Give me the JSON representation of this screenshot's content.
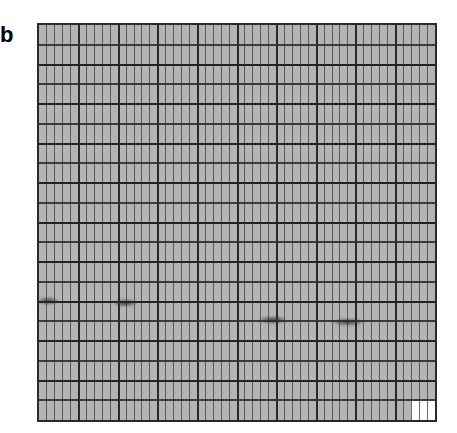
{
  "panel": {
    "label": "b"
  },
  "grid": {
    "columns": 50,
    "rows": 20,
    "major_column_every": 5,
    "background_color": "#b4b4b4",
    "line_color": "#2a2a2a"
  },
  "bands": [
    {
      "x": 38,
      "y": 298,
      "w": 20,
      "h": 6
    },
    {
      "x": 114,
      "y": 300,
      "w": 22,
      "h": 6
    },
    {
      "x": 260,
      "y": 317,
      "w": 26,
      "h": 6
    },
    {
      "x": 334,
      "y": 319,
      "w": 28,
      "h": 6
    }
  ],
  "white_cells": {
    "count": 3,
    "position": "bottom-right"
  }
}
